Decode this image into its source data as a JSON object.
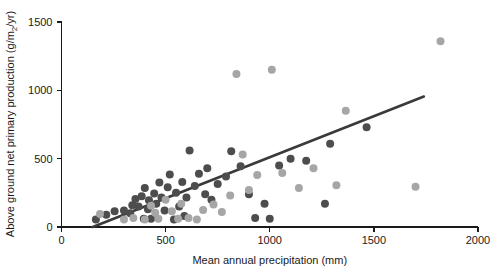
{
  "chart_data": {
    "type": "scatter",
    "title": "",
    "xlabel": "Mean annual precipitation (mm)",
    "ylabel_parts": {
      "before": "Above ground net primary production (g/m",
      "sub": "2",
      "after": "/yr)"
    },
    "ylabel": "Above ground net primary production (g/m2/yr)",
    "xlim": [
      0,
      2000
    ],
    "ylim": [
      0,
      1500
    ],
    "xticks": [
      0,
      500,
      1000,
      1500,
      2000
    ],
    "yticks": [
      0,
      500,
      1000,
      1500
    ],
    "grid": false,
    "legend": "none",
    "colors": {
      "dark_points": "#4d4d4d",
      "light_points": "#a6a6a6",
      "trend_line": "#3a3a3a",
      "axis": "#1a1a1a",
      "background": "#ffffff"
    },
    "marker_radius_px": 4,
    "series": [
      {
        "name": "dark",
        "color": "#4d4d4d",
        "points": [
          [
            165,
            55
          ],
          [
            215,
            90
          ],
          [
            255,
            115
          ],
          [
            300,
            120
          ],
          [
            330,
            100
          ],
          [
            340,
            160
          ],
          [
            355,
            205
          ],
          [
            370,
            150
          ],
          [
            385,
            225
          ],
          [
            395,
            60
          ],
          [
            400,
            285
          ],
          [
            415,
            130
          ],
          [
            420,
            195
          ],
          [
            430,
            60
          ],
          [
            445,
            245
          ],
          [
            455,
            170
          ],
          [
            470,
            325
          ],
          [
            480,
            215
          ],
          [
            495,
            120
          ],
          [
            510,
            290
          ],
          [
            520,
            385
          ],
          [
            540,
            55
          ],
          [
            550,
            250
          ],
          [
            565,
            150
          ],
          [
            580,
            330
          ],
          [
            590,
            80
          ],
          [
            600,
            215
          ],
          [
            615,
            560
          ],
          [
            640,
            300
          ],
          [
            660,
            390
          ],
          [
            690,
            240
          ],
          [
            700,
            430
          ],
          [
            720,
            200
          ],
          [
            750,
            315
          ],
          [
            790,
            370
          ],
          [
            815,
            555
          ],
          [
            860,
            445
          ],
          [
            900,
            240
          ],
          [
            930,
            65
          ],
          [
            975,
            170
          ],
          [
            1000,
            60
          ],
          [
            1045,
            450
          ],
          [
            1100,
            500
          ],
          [
            1175,
            485
          ],
          [
            1265,
            170
          ],
          [
            1290,
            610
          ],
          [
            1465,
            730
          ]
        ]
      },
      {
        "name": "light",
        "color": "#a6a6a6",
        "points": [
          [
            185,
            95
          ],
          [
            300,
            55
          ],
          [
            345,
            65
          ],
          [
            400,
            55
          ],
          [
            430,
            155
          ],
          [
            450,
            105
          ],
          [
            465,
            60
          ],
          [
            500,
            200
          ],
          [
            530,
            115
          ],
          [
            560,
            60
          ],
          [
            575,
            170
          ],
          [
            610,
            65
          ],
          [
            650,
            55
          ],
          [
            680,
            125
          ],
          [
            730,
            165
          ],
          [
            770,
            110
          ],
          [
            810,
            230
          ],
          [
            840,
            1120
          ],
          [
            870,
            530
          ],
          [
            900,
            270
          ],
          [
            940,
            380
          ],
          [
            1010,
            1150
          ],
          [
            1060,
            395
          ],
          [
            1140,
            285
          ],
          [
            1210,
            430
          ],
          [
            1320,
            305
          ],
          [
            1365,
            850
          ],
          [
            1700,
            295
          ],
          [
            1820,
            1360
          ]
        ]
      }
    ],
    "trend": {
      "x_start": 150,
      "y_start": 0,
      "x_end": 1740,
      "y_end": 955
    }
  }
}
